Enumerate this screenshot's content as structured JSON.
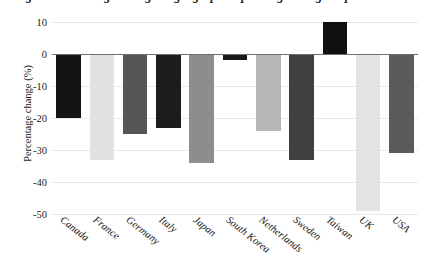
{
  "chart_data": {
    "type": "bar",
    "title": "Figure: Percentage change in geographic spending during the period 2020–2021",
    "xlabel": "",
    "ylabel": "Percentage change (%)",
    "categories": [
      "Canada",
      "France",
      "Germany",
      "Italy",
      "Japan",
      "South Korea",
      "Netherlands",
      "Sweden",
      "Taiwan",
      "UK",
      "USA"
    ],
    "values": [
      -20,
      -33,
      -25,
      -23,
      -34,
      -2,
      -24,
      -33,
      10,
      -49,
      -31
    ],
    "ylim": [
      -50,
      10
    ],
    "yticks": [
      10,
      0,
      -10,
      -20,
      -30,
      -40,
      -50
    ],
    "ytick_labels": [
      "10",
      "0",
      "-10",
      "-20",
      "-30",
      "-40",
      "-50"
    ],
    "grid": true,
    "legend": "none",
    "bar_colors": [
      "#141414",
      "#e2e2e2",
      "#565656",
      "#1c1c1c",
      "#8d8d8d",
      "#181818",
      "#b6b6b6",
      "#404040",
      "#101010",
      "#e4e4e4",
      "#5b5b5b"
    ],
    "zero_line_color": "#6f6f6f",
    "grid_color": "#e9e9e9"
  }
}
